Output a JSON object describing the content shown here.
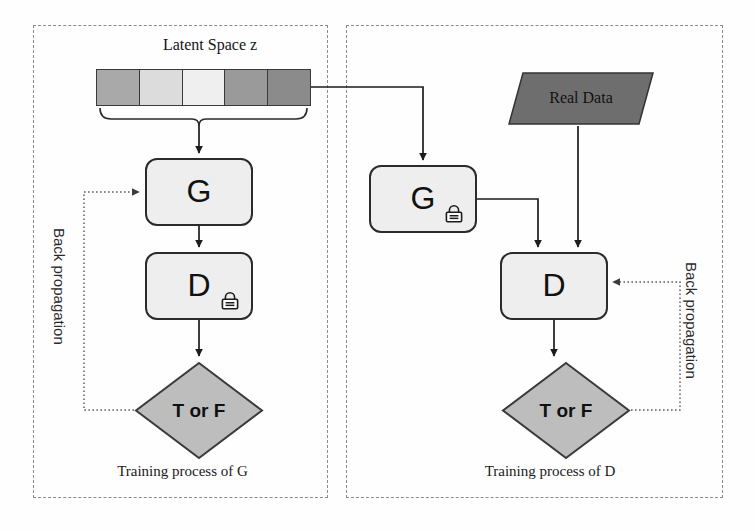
{
  "diagram": {
    "panels": [
      {
        "id": "left",
        "caption": "Training process of G",
        "backprop_label": "Back propagation"
      },
      {
        "id": "right",
        "caption": "Training process of D",
        "backprop_label": "Back propagation"
      }
    ],
    "latent": {
      "title": "Latent Space z",
      "cells": [
        {
          "index": 1,
          "color": "#a9a9a9"
        },
        {
          "index": 2,
          "color": "#dcdcdc"
        },
        {
          "index": 3,
          "color": "#efefef"
        },
        {
          "index": 4,
          "color": "#9a9a9a"
        },
        {
          "index": 5,
          "color": "#8b8b8b"
        }
      ]
    },
    "nodes": {
      "generator_left": {
        "label": "G",
        "locked": false,
        "icon": ""
      },
      "discriminator_left": {
        "label": "D",
        "locked": true,
        "icon": "lock-icon"
      },
      "generator_right": {
        "label": "G",
        "locked": true,
        "icon": "lock-icon"
      },
      "discriminator_right": {
        "label": "D",
        "locked": false,
        "icon": ""
      },
      "output_left": {
        "label": "T or F"
      },
      "output_right": {
        "label": "T or F"
      },
      "real_data": {
        "label": "Real Data"
      }
    },
    "colors": {
      "box_fill": "#eeeeee",
      "box_stroke": "#2b2b2b",
      "diamond_fill": "#bdbdbd",
      "diamond_stroke": "#3a3a3a",
      "real_data_fill": "#6e6e6e",
      "real_data_stroke": "#333333",
      "panel_border": "#8a8a8a",
      "arrow": "#1c1c1c",
      "backprop_arrow": "#6d6d6d",
      "page_background": "#ffffff"
    }
  }
}
